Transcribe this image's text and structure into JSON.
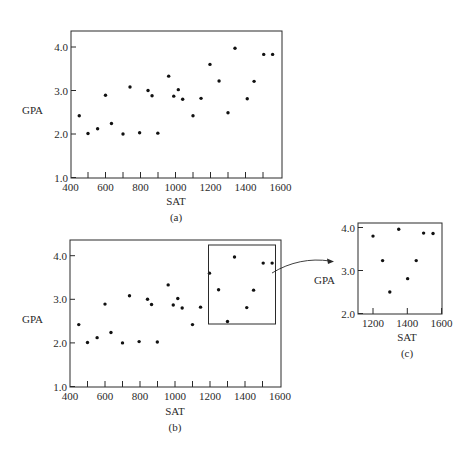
{
  "figure": {
    "panel_a": {
      "caption": "(a)",
      "xlabel": "SAT",
      "ylabel": "GPA"
    },
    "panel_b": {
      "caption": "(b)",
      "xlabel": "SAT",
      "ylabel": "GPA"
    },
    "panel_c": {
      "caption": "(c)",
      "xlabel": "SAT",
      "ylabel": "GPA"
    }
  },
  "chart_data": [
    {
      "id": "a",
      "type": "scatter",
      "title": "",
      "caption": "(a)",
      "xlabel": "SAT",
      "ylabel": "GPA",
      "xlim": [
        400,
        1600
      ],
      "ylim": [
        1.0,
        4.3
      ],
      "xticks": [
        400,
        600,
        800,
        1000,
        1200,
        1400,
        1600
      ],
      "xminor_ticks": [
        500,
        600,
        700,
        800,
        900,
        1000,
        1100,
        1200,
        1300,
        1400,
        1500
      ],
      "yticks": [
        1.0,
        2.0,
        3.0,
        4.0
      ],
      "ytick_labels": [
        "1.0",
        "2.0",
        "3.0",
        "4.0"
      ],
      "grid": false,
      "x": [
        450,
        500,
        555,
        600,
        634,
        700,
        740,
        795,
        843,
        866,
        899,
        961,
        990,
        1016,
        1041,
        1100,
        1146,
        1197,
        1249,
        1300,
        1340,
        1410,
        1449,
        1504,
        1555
      ],
      "y": [
        2.42,
        2.01,
        2.12,
        2.89,
        2.24,
        2.0,
        3.08,
        2.03,
        3.0,
        2.88,
        2.02,
        3.33,
        2.87,
        3.02,
        2.8,
        2.42,
        2.82,
        3.6,
        3.22,
        2.49,
        3.97,
        2.81,
        3.21,
        3.83,
        3.83
      ]
    },
    {
      "id": "b",
      "type": "scatter",
      "title": "",
      "caption": "(b)",
      "xlabel": "SAT",
      "ylabel": "GPA",
      "xlim": [
        400,
        1600
      ],
      "ylim": [
        1.0,
        4.3
      ],
      "xticks": [
        400,
        600,
        800,
        1000,
        1200,
        1400,
        1600
      ],
      "xminor_ticks": [
        500,
        600,
        700,
        800,
        900,
        1000,
        1100,
        1200,
        1300,
        1400,
        1500
      ],
      "yticks": [
        1.0,
        2.0,
        3.0,
        4.0
      ],
      "ytick_labels": [
        "1.0",
        "2.0",
        "3.0",
        "4.0"
      ],
      "grid": false,
      "x": [
        450,
        500,
        555,
        600,
        634,
        700,
        740,
        795,
        843,
        866,
        899,
        961,
        990,
        1016,
        1041,
        1100,
        1146,
        1197,
        1249,
        1300,
        1340,
        1410,
        1449,
        1504,
        1555
      ],
      "y": [
        2.42,
        2.01,
        2.12,
        2.89,
        2.24,
        2.0,
        3.08,
        2.03,
        3.0,
        2.88,
        2.02,
        3.33,
        2.87,
        3.02,
        2.8,
        2.42,
        2.82,
        3.6,
        3.22,
        2.49,
        3.97,
        2.81,
        3.21,
        3.83,
        3.83
      ],
      "annotations": [
        {
          "type": "rectangle",
          "label": "zoom region",
          "x_range": [
            1180,
            1560
          ],
          "y_range": [
            2.4,
            4.2
          ]
        },
        {
          "type": "arrow",
          "from": "rectangle",
          "to": "panel c"
        }
      ]
    },
    {
      "id": "c",
      "type": "scatter",
      "title": "",
      "caption": "(c)",
      "xlabel": "SAT",
      "ylabel": "GPA",
      "xlim": [
        1100,
        1600
      ],
      "ylim": [
        2.0,
        4.2
      ],
      "xticks": [
        1200,
        1400,
        1600
      ],
      "yticks": [
        2.0,
        3.0,
        4.0
      ],
      "ytick_labels": [
        "2.0",
        "3.0",
        "4.0"
      ],
      "grid": false,
      "x": [
        1200,
        1256,
        1298,
        1350,
        1402,
        1452,
        1495,
        1550
      ],
      "y": [
        3.8,
        3.23,
        2.5,
        3.96,
        2.81,
        3.23,
        3.87,
        3.86
      ]
    }
  ]
}
